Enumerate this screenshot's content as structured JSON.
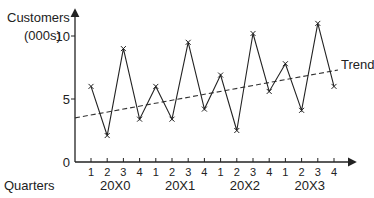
{
  "chart_data": {
    "type": "line",
    "title": "",
    "ylabel": "Customers (000s)",
    "ylabel_lines": [
      "Customers",
      "(000s)"
    ],
    "xlabel": "Quarters",
    "ylim": [
      0,
      12
    ],
    "yticks": [
      0,
      5,
      10
    ],
    "ytick_labels": [
      "0",
      "5",
      "10"
    ],
    "grid": false,
    "legend": null,
    "quarters": [
      "1",
      "2",
      "3",
      "4",
      "1",
      "2",
      "3",
      "4",
      "1",
      "2",
      "3",
      "4",
      "1",
      "2",
      "3",
      "4"
    ],
    "years": [
      "20X0",
      "20X1",
      "20X2",
      "20X3"
    ],
    "x": [
      "20X0 Q1",
      "20X0 Q2",
      "20X0 Q3",
      "20X0 Q4",
      "20X1 Q1",
      "20X1 Q2",
      "20X1 Q3",
      "20X1 Q4",
      "20X2 Q1",
      "20X2 Q2",
      "20X2 Q3",
      "20X2 Q4",
      "20X3 Q1",
      "20X3 Q2",
      "20X3 Q3",
      "20X3 Q4"
    ],
    "series": [
      {
        "name": "Customers",
        "style": "solid line with x markers",
        "values": [
          6.0,
          2.1,
          9.0,
          3.4,
          6.0,
          3.4,
          9.5,
          4.2,
          6.9,
          2.5,
          10.2,
          5.6,
          7.8,
          4.1,
          11.0,
          6.0
        ]
      },
      {
        "name": "Trend",
        "style": "dashed line",
        "start": 3.5,
        "end": 7.3
      }
    ],
    "annotations": [
      {
        "text": "Trend",
        "position": "right end of trend line"
      }
    ]
  }
}
